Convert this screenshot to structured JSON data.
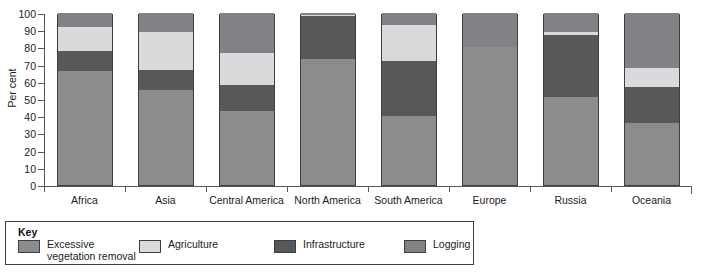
{
  "chart_data": {
    "type": "bar",
    "title": "",
    "subtitle": "",
    "xlabel": "",
    "ylabel": "Per cent",
    "ylim": [
      0,
      100
    ],
    "ytick_step": 10,
    "yticks": [
      0,
      10,
      20,
      30,
      40,
      50,
      60,
      70,
      80,
      90,
      100
    ],
    "grid": false,
    "stacked": true,
    "stack_total": 100,
    "legend_position": "bottom",
    "legend_title": "Key",
    "categories": [
      "Africa",
      "Asia",
      "Central America",
      "North America",
      "South America",
      "Europe",
      "Russia",
      "Oceania"
    ],
    "series": [
      {
        "name": "Excessive vegetation removal",
        "color": "#8a8c8e",
        "values": [
          66,
          55,
          43,
          73,
          40,
          80,
          51,
          36
        ]
      },
      {
        "name": "Infrastructure",
        "color": "#56585a",
        "values": [
          12,
          12,
          15,
          25,
          32,
          0,
          36,
          21
        ]
      },
      {
        "name": "Agriculture",
        "color": "#d9dadb",
        "values": [
          14,
          22,
          19,
          1,
          21,
          0,
          2,
          11
        ]
      },
      {
        "name": "Logging",
        "color": "#808285",
        "values": [
          8,
          11,
          23,
          1,
          7,
          20,
          11,
          32
        ]
      }
    ]
  },
  "legend": {
    "title": "Key",
    "items": [
      {
        "label": "Excessive\nvegetation removal",
        "color": "#8a8c8e"
      },
      {
        "label": "Agriculture",
        "color": "#d9dadb"
      },
      {
        "label": "Infrastructure",
        "color": "#56585a"
      },
      {
        "label": "Logging",
        "color": "#808285"
      }
    ]
  }
}
